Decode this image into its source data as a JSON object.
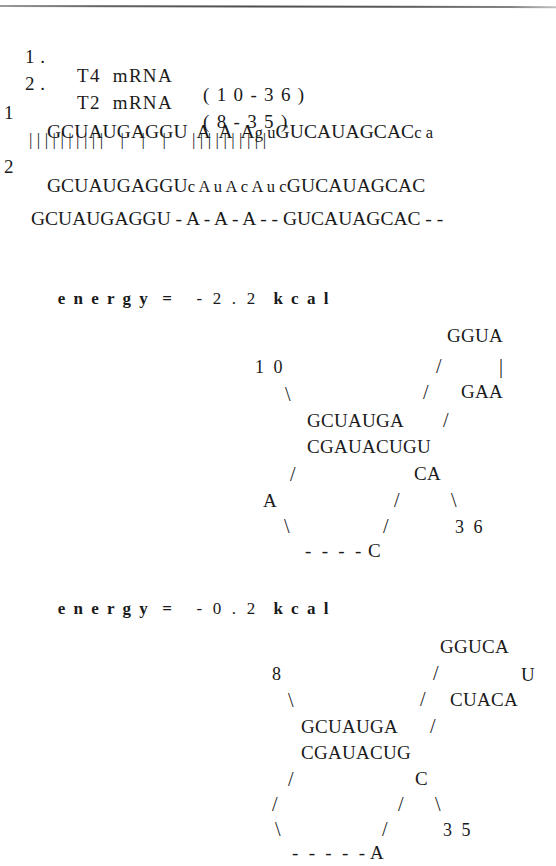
{
  "document": {
    "title": "T4 / T2 mRNA structure comparison"
  },
  "header": {
    "entries": [
      {
        "number": "1 .",
        "name": "T4  mRNA",
        "range": "( 1 0 - 3 6 )"
      },
      {
        "number": "2 .",
        "name": "T2  mRNA",
        "range": "( 8 - 3 5 )"
      }
    ]
  },
  "alignment": {
    "row1_label": "1",
    "row2_label": "2",
    "row1_seq_a": "GCUAUGAGGU  A  A  A",
    "row1_seq_lc1": "g u",
    "row1_seq_b": "GUCAUAGCAC",
    "row1_seq_lc2": "c a",
    "match_bars": "| | | | | | | | | |    |    |    |      | | | | | | | | | |",
    "row2_seq_a": "GCUAUGAGGU",
    "row2_seq_lc1": "c A u A c A u c",
    "row2_seq_b": "GUCAUAGCAC",
    "consensus": "GCUAUGAGGU - A - A - A - - GUCAUAGCAC - -"
  },
  "structures": [
    {
      "energy_label": "e n e r g y  =",
      "energy_value": "- 2 . 2",
      "energy_unit": "k c a l",
      "start_position": "1 0",
      "end_position": "3 6",
      "loop_top": "GGUA",
      "loop_right": "GAA",
      "stem_top": "GCUAUGA",
      "stem_bottom": "CGAUACUGU",
      "bulge_right": "CA",
      "bulge_left": "A",
      "tail_base": "C",
      "tail_dashes": "- - - -",
      "right_bar": "|"
    },
    {
      "energy_label": "e n e r g y  =",
      "energy_value": "- 0 . 2",
      "energy_unit": "k c a l",
      "start_position": "8",
      "end_position": "3 5",
      "loop_top": "GGUCA",
      "loop_right": "CUACA",
      "loop_corner": "U",
      "stem_top": "GCUAUGA",
      "stem_bottom": "CGAUACUG",
      "bulge_right": "C",
      "tail_base": "A",
      "tail_dashes": "- - - - -"
    }
  ],
  "glyphs": {
    "slash": "/",
    "backslash": "\\",
    "vbar": "|"
  }
}
